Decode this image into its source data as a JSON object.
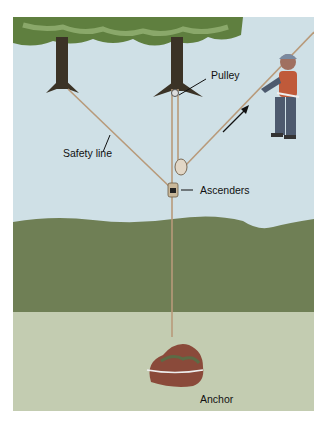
{
  "diagram": {
    "labels": {
      "pulley": "Pulley",
      "safety_line": "Safety line",
      "ascenders": "Ascenders",
      "anchor": "Anchor"
    },
    "colors": {
      "sky": "#cfe0e6",
      "foliage": "#5f7f3f",
      "foliage_light": "#8aa86a",
      "trunk": "#3b3326",
      "rope": "#b89a7a",
      "ground_dark": "#6f7f55",
      "ground_light": "#c3ccb1",
      "rock": "#8a4a3a",
      "climber_suit": "#4d5a6e",
      "climber_vest": "#c05a3a",
      "arrow": "#111111"
    }
  }
}
